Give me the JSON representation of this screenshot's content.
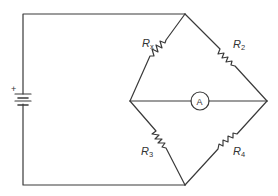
{
  "diagram": {
    "type": "wheatstone-bridge-circuit",
    "colors": {
      "line": "#3a3a3a",
      "text": "#333333",
      "background": "#ffffff"
    },
    "battery": {
      "polarity_label": "+"
    },
    "resistors": [
      {
        "id": "Rx",
        "main": "R",
        "sub": "x"
      },
      {
        "id": "R2",
        "main": "R",
        "sub": "2"
      },
      {
        "id": "R3",
        "main": "R",
        "sub": "3"
      },
      {
        "id": "R4",
        "main": "R",
        "sub": "4"
      }
    ],
    "ammeter": {
      "label": "A"
    }
  }
}
